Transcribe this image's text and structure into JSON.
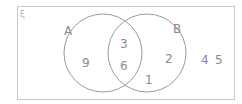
{
  "diagram": {
    "type": "venn",
    "universal_symbol": "ξ",
    "sets": [
      {
        "name": "A",
        "label": "A"
      },
      {
        "name": "B",
        "label": "B"
      }
    ],
    "regions": {
      "A_only": [
        "9"
      ],
      "A_and_B": [
        "3",
        "6"
      ],
      "B_only": [
        "2",
        "1"
      ],
      "outside": [
        "4",
        "5"
      ]
    },
    "colors": {
      "border": "#c8c8c8",
      "circle": "#9a9a9a",
      "text": "#8a8a8a"
    }
  }
}
